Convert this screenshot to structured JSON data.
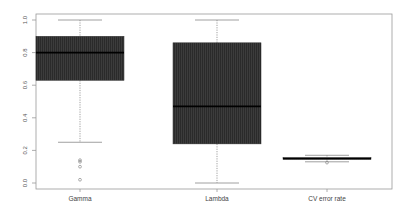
{
  "chart_data": {
    "type": "boxplot",
    "title": "",
    "xlabel": "",
    "ylabel": "",
    "ylim": [
      0.0,
      1.0
    ],
    "yticks": [
      "0.0",
      "0.2",
      "0.4",
      "0.6",
      "0.8",
      "1.0"
    ],
    "grid": false,
    "legend": null,
    "categories": [
      "Gamma",
      "Lambda",
      "CV error rate"
    ],
    "boxes": [
      {
        "name": "Gamma",
        "whisker_low": 0.25,
        "q1": 0.63,
        "median": 0.8,
        "q3": 0.9,
        "whisker_high": 1.0,
        "outliers": [
          0.14,
          0.13,
          0.1,
          0.02
        ]
      },
      {
        "name": "Lambda",
        "whisker_low": 0.0,
        "q1": 0.24,
        "median": 0.47,
        "q3": 0.86,
        "whisker_high": 1.0,
        "outliers": []
      },
      {
        "name": "CV error rate",
        "whisker_low": 0.13,
        "q1": 0.145,
        "median": 0.15,
        "q3": 0.155,
        "whisker_high": 0.17,
        "outliers": [
          0.125
        ]
      }
    ],
    "colors": {
      "box_fill": "#3c3c3c",
      "median": "#000000",
      "whisker": "#888888",
      "frame": "#999999"
    }
  }
}
